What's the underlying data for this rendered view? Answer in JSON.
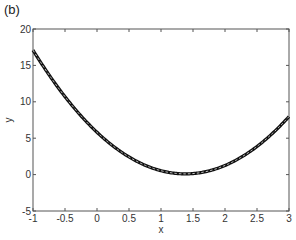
{
  "panel_label": "(b)",
  "chart_data": {
    "type": "line",
    "title": "",
    "panel": "(b)",
    "xlabel": "x",
    "ylabel": "y",
    "xlim": [
      -1,
      3
    ],
    "ylim": [
      -5,
      20
    ],
    "xticks": [
      -1,
      -0.5,
      0,
      0.5,
      1,
      1.5,
      2,
      2.5,
      3
    ],
    "xtick_labels": [
      "-1",
      "-0.5",
      "0",
      "0.5",
      "1",
      "1.5",
      "2",
      "2.5",
      "3"
    ],
    "yticks": [
      -5,
      0,
      5,
      10,
      15,
      20
    ],
    "ytick_labels": [
      "-5",
      "0",
      "5",
      "10",
      "15",
      "20"
    ],
    "grid": false,
    "legend": null,
    "series": [
      {
        "name": "fit (solid thick)",
        "style": "solid-black-thick",
        "x": [
          -1,
          -0.75,
          -0.5,
          -0.25,
          0,
          0.25,
          0.5,
          0.75,
          1,
          1.25,
          1.38,
          1.5,
          1.75,
          2,
          2.25,
          2.5,
          2.75,
          3
        ],
        "y": [
          17.0,
          14.3,
          10.7,
          8.1,
          5.8,
          3.9,
          2.4,
          1.3,
          0.5,
          0.15,
          0.1,
          0.14,
          0.5,
          1.25,
          2.4,
          3.9,
          5.7,
          8.0
        ]
      },
      {
        "name": "data (dashed light)",
        "style": "dashed-white-thin",
        "x": [
          -1,
          -0.75,
          -0.5,
          -0.25,
          0,
          0.25,
          0.5,
          0.75,
          1,
          1.25,
          1.38,
          1.5,
          1.75,
          2,
          2.25,
          2.5,
          2.75,
          3
        ],
        "y": [
          17.0,
          14.3,
          10.7,
          8.1,
          5.8,
          3.9,
          2.4,
          1.3,
          0.5,
          0.15,
          0.1,
          0.14,
          0.5,
          1.25,
          2.4,
          3.9,
          5.7,
          8.0
        ]
      }
    ],
    "model": "y ≈ 3(x − 1.38)^2 + 0.1"
  }
}
